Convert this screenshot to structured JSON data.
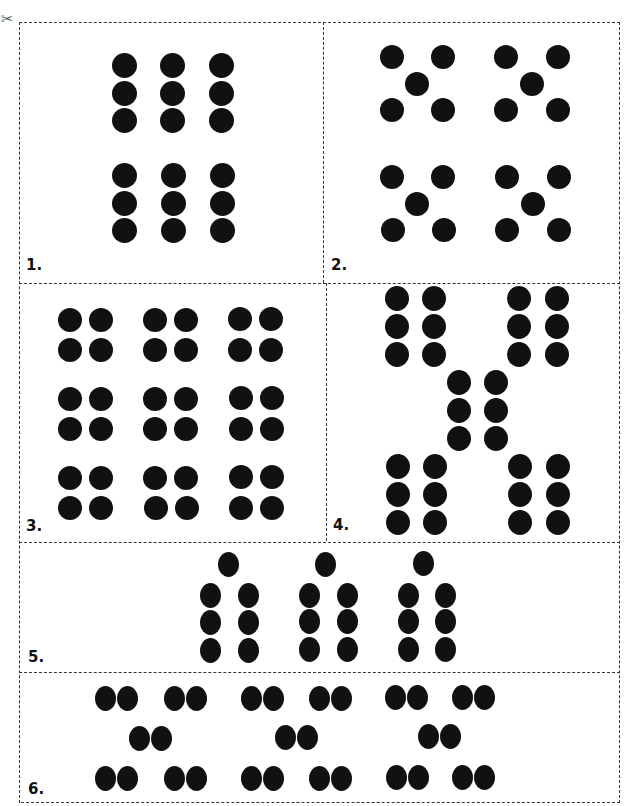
{
  "page": {
    "scissors_icon": "✂",
    "dot_color": "#111111",
    "border_color": "#333333"
  },
  "cards": [
    {
      "label": "1.",
      "box": [
        19,
        22,
        304,
        261
      ],
      "label_pos": [
        26,
        256
      ],
      "dot_size": [
        25,
        25
      ],
      "dots": [
        [
          124,
          65
        ],
        [
          172,
          65
        ],
        [
          221,
          65
        ],
        [
          124,
          93
        ],
        [
          172,
          93
        ],
        [
          221,
          93
        ],
        [
          124,
          120
        ],
        [
          172,
          120
        ],
        [
          221,
          120
        ],
        [
          124,
          175
        ],
        [
          173,
          175
        ],
        [
          222,
          175
        ],
        [
          124,
          203
        ],
        [
          173,
          203
        ],
        [
          222,
          203
        ],
        [
          124,
          230
        ],
        [
          173,
          230
        ],
        [
          222,
          230
        ]
      ]
    },
    {
      "label": "2.",
      "box": [
        323,
        22,
        297,
        261
      ],
      "label_pos": [
        331,
        256
      ],
      "dot_size": [
        24,
        24
      ],
      "dots": [
        [
          392,
          57
        ],
        [
          443,
          57
        ],
        [
          417,
          84
        ],
        [
          392,
          110
        ],
        [
          443,
          110
        ],
        [
          506,
          57
        ],
        [
          558,
          57
        ],
        [
          532,
          84
        ],
        [
          506,
          110
        ],
        [
          558,
          110
        ],
        [
          392,
          177
        ],
        [
          443,
          177
        ],
        [
          417,
          204
        ],
        [
          393,
          230
        ],
        [
          444,
          230
        ],
        [
          507,
          177
        ],
        [
          559,
          177
        ],
        [
          533,
          204
        ],
        [
          507,
          230
        ],
        [
          559,
          230
        ]
      ]
    },
    {
      "label": "3.",
      "box": [
        19,
        283,
        307,
        260
      ],
      "label_pos": [
        26,
        517
      ],
      "dot_size": [
        24,
        24
      ],
      "dots": [
        [
          70,
          320
        ],
        [
          101,
          320
        ],
        [
          155,
          320
        ],
        [
          186,
          320
        ],
        [
          240,
          319
        ],
        [
          271,
          319
        ],
        [
          70,
          350
        ],
        [
          101,
          350
        ],
        [
          155,
          350
        ],
        [
          186,
          350
        ],
        [
          240,
          350
        ],
        [
          271,
          350
        ],
        [
          70,
          399
        ],
        [
          101,
          399
        ],
        [
          155,
          399
        ],
        [
          186,
          399
        ],
        [
          241,
          398
        ],
        [
          272,
          398
        ],
        [
          70,
          429
        ],
        [
          101,
          429
        ],
        [
          155,
          429
        ],
        [
          186,
          429
        ],
        [
          241,
          429
        ],
        [
          272,
          429
        ],
        [
          70,
          478
        ],
        [
          101,
          478
        ],
        [
          155,
          478
        ],
        [
          186,
          478
        ],
        [
          241,
          477
        ],
        [
          272,
          477
        ],
        [
          70,
          508
        ],
        [
          101,
          508
        ],
        [
          156,
          508
        ],
        [
          187,
          508
        ],
        [
          241,
          508
        ],
        [
          272,
          508
        ]
      ]
    },
    {
      "label": "4.",
      "box": [
        326,
        280,
        294,
        261
      ],
      "label_pos": [
        333,
        516
      ],
      "dot_size": [
        24,
        25
      ],
      "dots": [
        [
          397,
          298
        ],
        [
          434,
          298
        ],
        [
          397,
          326
        ],
        [
          434,
          326
        ],
        [
          397,
          354
        ],
        [
          434,
          354
        ],
        [
          519,
          298
        ],
        [
          557,
          298
        ],
        [
          519,
          326
        ],
        [
          557,
          326
        ],
        [
          519,
          354
        ],
        [
          557,
          354
        ],
        [
          459,
          382
        ],
        [
          496,
          382
        ],
        [
          459,
          410
        ],
        [
          496,
          410
        ],
        [
          459,
          438
        ],
        [
          496,
          438
        ],
        [
          398,
          466
        ],
        [
          435,
          466
        ],
        [
          398,
          494
        ],
        [
          435,
          494
        ],
        [
          398,
          522
        ],
        [
          435,
          522
        ],
        [
          520,
          466
        ],
        [
          558,
          466
        ],
        [
          520,
          494
        ],
        [
          558,
          494
        ],
        [
          520,
          522
        ],
        [
          558,
          522
        ]
      ]
    },
    {
      "label": "5.",
      "box": [
        21,
        541,
        599,
        130
      ],
      "label_pos": [
        28,
        648
      ],
      "dot_size": [
        21,
        25
      ],
      "dots": [
        [
          228,
          564
        ],
        [
          325,
          564
        ],
        [
          423,
          563
        ],
        [
          210,
          595
        ],
        [
          248,
          595
        ],
        [
          309,
          595
        ],
        [
          347,
          595
        ],
        [
          408,
          595
        ],
        [
          445,
          595
        ],
        [
          210,
          622
        ],
        [
          248,
          622
        ],
        [
          309,
          621
        ],
        [
          347,
          621
        ],
        [
          408,
          621
        ],
        [
          445,
          621
        ],
        [
          210,
          650
        ],
        [
          248,
          650
        ],
        [
          309,
          649
        ],
        [
          347,
          649
        ],
        [
          408,
          649
        ],
        [
          445,
          649
        ]
      ]
    },
    {
      "label": "6.",
      "box": [
        21,
        674,
        599,
        129
      ],
      "label_pos": [
        28,
        780
      ],
      "dot_size": [
        21,
        25
      ],
      "dots": [
        [
          105,
          698
        ],
        [
          127,
          698
        ],
        [
          174,
          698
        ],
        [
          196,
          698
        ],
        [
          251,
          698
        ],
        [
          273,
          698
        ],
        [
          319,
          698
        ],
        [
          341,
          698
        ],
        [
          395,
          697
        ],
        [
          417,
          697
        ],
        [
          462,
          697
        ],
        [
          484,
          697
        ],
        [
          139,
          738
        ],
        [
          161,
          738
        ],
        [
          285,
          737
        ],
        [
          307,
          737
        ],
        [
          428,
          736
        ],
        [
          450,
          736
        ],
        [
          105,
          778
        ],
        [
          127,
          778
        ],
        [
          174,
          778
        ],
        [
          196,
          778
        ],
        [
          251,
          778
        ],
        [
          273,
          778
        ],
        [
          319,
          778
        ],
        [
          341,
          778
        ],
        [
          396,
          777
        ],
        [
          418,
          777
        ],
        [
          462,
          777
        ],
        [
          484,
          777
        ]
      ]
    }
  ]
}
